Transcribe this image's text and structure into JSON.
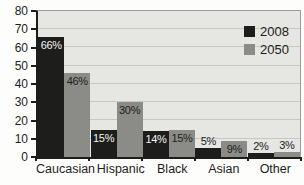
{
  "chart_data": {
    "type": "bar",
    "title": "",
    "categories": [
      "Caucasian",
      "Hispanic",
      "Black",
      "Asian",
      "Other"
    ],
    "series": [
      {
        "name": "2008",
        "color": "#1d1d1b",
        "label_color_inside": "#f4f4f0",
        "values": [
          66,
          15,
          14,
          5,
          2
        ]
      },
      {
        "name": "2050",
        "color": "#8b8c88",
        "label_color_inside": "#1d1d1b",
        "values": [
          46,
          30,
          15,
          9,
          3
        ]
      }
    ],
    "value_suffix": "%",
    "ylim": [
      0,
      80
    ],
    "yticks": [
      0,
      10,
      20,
      30,
      40,
      50,
      60,
      70,
      80
    ],
    "grid": true,
    "legend_position": "top-right",
    "colors": {
      "plot_background": "#e6e6e2",
      "gridline": "#c7c8c3",
      "axis": "#1d1d1b",
      "frame": "#9c9c98",
      "text": "#1d1d1b",
      "label_above": "#1d1d1b"
    }
  }
}
